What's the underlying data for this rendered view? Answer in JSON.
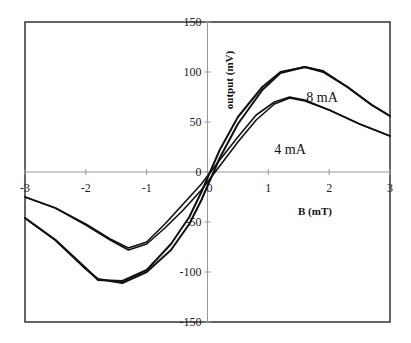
{
  "chart_data": {
    "type": "line",
    "title": "",
    "xlabel": "B (mT)",
    "ylabel": "output (mV)",
    "xlim": [
      -3,
      3
    ],
    "ylim": [
      -150,
      150
    ],
    "x_ticks": [
      -3,
      -2,
      -1,
      0,
      1,
      2,
      3
    ],
    "y_ticks": [
      -150,
      -100,
      -50,
      0,
      50,
      100,
      150
    ],
    "x_tick_labels": [
      "-3",
      "-2",
      "-1",
      "0",
      "1",
      "2",
      "3"
    ],
    "y_tick_labels": [
      "-150",
      "-100",
      "-50",
      "0",
      "50",
      "100",
      "150"
    ],
    "grid": false,
    "legend": "none",
    "annotations": [
      {
        "text": "8 mA",
        "series": "8 mA"
      },
      {
        "text": "4 mA",
        "series": "4 mA"
      }
    ],
    "series": [
      {
        "name": "4 mA (sweep up)",
        "x": [
          -3,
          -2.5,
          -2,
          -1.6,
          -1.3,
          -1.0,
          -0.7,
          -0.4,
          -0.1,
          0,
          0.2,
          0.5,
          0.8,
          1.1,
          1.35,
          1.6,
          2.0,
          2.5,
          3.0
        ],
        "y": [
          -25,
          -36,
          -52,
          -67,
          -76,
          -70,
          -52,
          -32,
          -12,
          -4,
          12,
          35,
          57,
          70,
          75,
          72,
          62,
          48,
          36
        ]
      },
      {
        "name": "4 mA (sweep down)",
        "x": [
          -3,
          -2.5,
          -2,
          -1.6,
          -1.3,
          -1.0,
          -0.7,
          -0.4,
          -0.1,
          0,
          0.2,
          0.5,
          0.8,
          1.1,
          1.35,
          1.6,
          2.0,
          2.5,
          3.0
        ],
        "y": [
          -25,
          -36,
          -53,
          -68,
          -78,
          -72,
          -56,
          -38,
          -18,
          -10,
          6,
          30,
          52,
          68,
          74,
          71,
          62,
          48,
          36
        ]
      },
      {
        "name": "8 mA (sweep up)",
        "x": [
          -3,
          -2.5,
          -2,
          -1.8,
          -1.4,
          -1.0,
          -0.6,
          -0.3,
          -0.1,
          0,
          0.2,
          0.5,
          0.9,
          1.2,
          1.6,
          1.9,
          2.3,
          2.7,
          3.0
        ],
        "y": [
          -46,
          -68,
          -96,
          -108,
          -109,
          -98,
          -72,
          -45,
          -20,
          -6,
          22,
          55,
          85,
          100,
          105,
          101,
          85,
          67,
          56
        ]
      },
      {
        "name": "8 mA (sweep down)",
        "x": [
          -3,
          -2.5,
          -2,
          -1.8,
          -1.4,
          -1.0,
          -0.6,
          -0.3,
          -0.1,
          0,
          0.2,
          0.5,
          0.9,
          1.2,
          1.6,
          1.9,
          2.3,
          2.7,
          3.0
        ],
        "y": [
          -46,
          -68,
          -97,
          -107,
          -111,
          -100,
          -78,
          -52,
          -28,
          -14,
          14,
          48,
          82,
          99,
          105,
          100,
          85,
          67,
          56
        ]
      }
    ]
  }
}
